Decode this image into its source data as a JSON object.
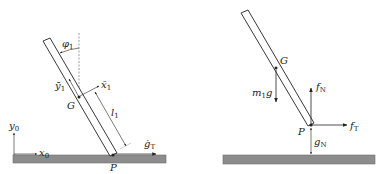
{
  "colors": {
    "ground": "#8c8c8c",
    "ground_edge": "#6e6e6e",
    "stroke": "#222222",
    "dashed": "#777777"
  },
  "left_panel": {
    "labels": {
      "phi": "φ",
      "phi_sub": "1",
      "ybar": "ȳ",
      "ybar_sub": "1",
      "xbar": "x̄",
      "xbar_sub": "1",
      "G": "G",
      "l": "l",
      "l_sub": "1",
      "gdot": "ġ",
      "gdot_sub": "T",
      "P": "P",
      "y0": "y",
      "y0_sub": "0",
      "x0": "x",
      "x0_sub": "0"
    }
  },
  "right_panel": {
    "labels": {
      "G": "G",
      "mg_m": "m",
      "mg_sub": "1",
      "mg_g": "g",
      "fN": "f",
      "fN_sub": "N",
      "fT": "f",
      "fT_sub": "T",
      "P": "P",
      "gN": "g",
      "gN_sub": "N"
    }
  }
}
